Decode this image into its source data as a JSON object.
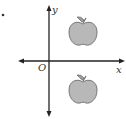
{
  "diagram": {
    "type": "coordinate-plane",
    "bullet": "•",
    "axes": {
      "x_label": "x",
      "y_label": "y",
      "origin_label": "O"
    },
    "objects": [
      {
        "name": "apple",
        "quadrant": "I",
        "position": "above x-axis, right of y-axis"
      },
      {
        "name": "apple",
        "quadrant": "IV",
        "position": "below x-axis, right of y-axis"
      }
    ],
    "colors": {
      "axis": "#222222",
      "apple_fill": "#b8b8b8",
      "apple_stroke": "#777777",
      "leaf_fill": "#9a9a9a"
    }
  }
}
